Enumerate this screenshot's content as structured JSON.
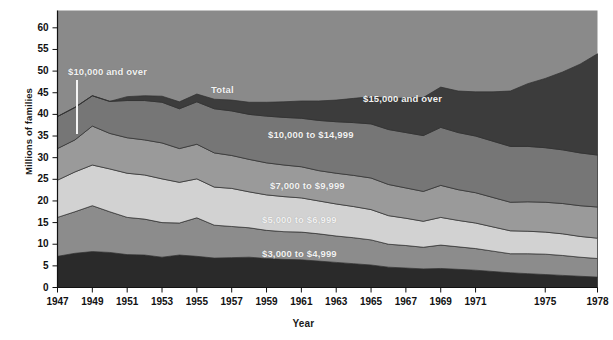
{
  "chart_data": {
    "type": "area",
    "title": "",
    "xlabel": "Year",
    "ylabel": "Millions of families",
    "xlim": [
      1947,
      1978
    ],
    "ylim": [
      0,
      64
    ],
    "grid": false,
    "legend_position": "inline-annotations",
    "stacked": true,
    "x": [
      1947,
      1948,
      1949,
      1950,
      1951,
      1952,
      1953,
      1954,
      1955,
      1956,
      1957,
      1958,
      1959,
      1960,
      1961,
      1962,
      1963,
      1964,
      1965,
      1966,
      1967,
      1968,
      1969,
      1970,
      1971,
      1972,
      1973,
      1974,
      1975,
      1976,
      1977,
      1978
    ],
    "series": [
      {
        "name": "Under $3,000",
        "color": "#2a2a2a",
        "values": [
          7.2,
          7.9,
          8.3,
          8.1,
          7.6,
          7.5,
          7.0,
          7.5,
          7.2,
          6.8,
          6.9,
          7.0,
          6.7,
          6.5,
          6.4,
          6.1,
          5.8,
          5.5,
          5.2,
          4.7,
          4.5,
          4.3,
          4.4,
          4.2,
          4.0,
          3.7,
          3.4,
          3.2,
          3.0,
          2.8,
          2.6,
          2.4
        ]
      },
      {
        "name": "$3,000 to $4,999",
        "color": "#8c8c8c",
        "values": [
          9.0,
          9.6,
          10.6,
          9.4,
          8.6,
          8.3,
          8.0,
          7.4,
          8.9,
          7.6,
          7.2,
          6.8,
          6.5,
          6.4,
          6.4,
          6.3,
          6.1,
          6.0,
          5.8,
          5.3,
          5.2,
          5.0,
          5.4,
          5.2,
          5.0,
          4.7,
          4.4,
          4.6,
          4.7,
          4.6,
          4.4,
          4.3
        ]
      },
      {
        "name": "$5,000 to $6,999",
        "color": "#d2d2d2",
        "values": [
          8.6,
          9.2,
          9.4,
          9.9,
          10.2,
          10.2,
          10.1,
          9.4,
          9.0,
          8.8,
          8.8,
          8.3,
          8.2,
          8.1,
          7.9,
          7.6,
          7.4,
          7.2,
          7.0,
          6.6,
          6.3,
          6.0,
          6.4,
          6.1,
          5.9,
          5.6,
          5.3,
          5.2,
          5.1,
          5.0,
          4.8,
          4.7
        ]
      },
      {
        "name": "$7,000 to $9,999",
        "color": "#9a9a9a",
        "values": [
          7.3,
          7.4,
          9.0,
          8.2,
          8.2,
          8.1,
          8.3,
          7.8,
          8.0,
          7.9,
          7.6,
          7.5,
          7.4,
          7.3,
          7.2,
          7.0,
          7.1,
          7.2,
          7.3,
          7.2,
          7.0,
          6.9,
          7.4,
          7.1,
          7.0,
          6.8,
          6.6,
          6.8,
          6.9,
          7.0,
          7.1,
          7.2
        ]
      },
      {
        "name": "$10,000 to $14,999",
        "color": "#767676",
        "values": [
          7.4,
          7.5,
          7.0,
          7.4,
          8.6,
          9.1,
          9.4,
          9.2,
          9.8,
          10.2,
          10.3,
          10.4,
          10.8,
          11.0,
          11.2,
          11.6,
          11.9,
          12.2,
          12.5,
          12.7,
          12.8,
          12.9,
          13.4,
          13.2,
          13.1,
          13.0,
          12.9,
          12.8,
          12.6,
          12.4,
          12.2,
          12.0
        ]
      },
      {
        "name": "$15,000 and over",
        "color": "#3c3c3c",
        "values": [
          0,
          0,
          0,
          0,
          0.9,
          1.1,
          1.4,
          1.6,
          1.8,
          2.2,
          2.5,
          2.8,
          3.2,
          3.6,
          4.0,
          4.5,
          5.0,
          5.6,
          6.3,
          7.2,
          8.0,
          8.8,
          9.3,
          9.6,
          10.2,
          11.4,
          12.8,
          14.5,
          16.0,
          18.0,
          20.5,
          23.4
        ]
      }
    ],
    "totals_note": "Total (top boundary of stack)",
    "y_ticks": [
      0,
      5,
      10,
      15,
      20,
      25,
      30,
      35,
      40,
      45,
      50,
      55,
      60
    ],
    "x_ticks": [
      1947,
      1949,
      1951,
      1953,
      1955,
      1957,
      1959,
      1961,
      1963,
      1965,
      1967,
      1969,
      1971,
      1975,
      1978
    ],
    "annotations": [
      {
        "name": "annotation-10000-and-over",
        "text": "$10,000 and over",
        "x_px": 68,
        "y_px": 66
      },
      {
        "name": "annotation-total",
        "text": "Total",
        "x_px": 211,
        "y_px": 84
      },
      {
        "name": "annotation-15000-and-over",
        "text": "$15,000 and over",
        "x_px": 363,
        "y_px": 93
      },
      {
        "name": "annotation-10000-to-14999",
        "text": "$10,000 to $14,999",
        "x_px": 268,
        "y_px": 129
      },
      {
        "name": "annotation-7000-to-9999",
        "text": "$7,000 to $9,999",
        "x_px": 270,
        "y_px": 180
      },
      {
        "name": "annotation-5000-to-6999",
        "text": "$5,000 to $6,999",
        "x_px": 262,
        "y_px": 214
      },
      {
        "name": "annotation-3000-to-4999",
        "text": "$3,000 to $4,999",
        "x_px": 262,
        "y_px": 248
      }
    ],
    "plot_background": "#8a8a8a",
    "figure_background": "#ffffff"
  }
}
